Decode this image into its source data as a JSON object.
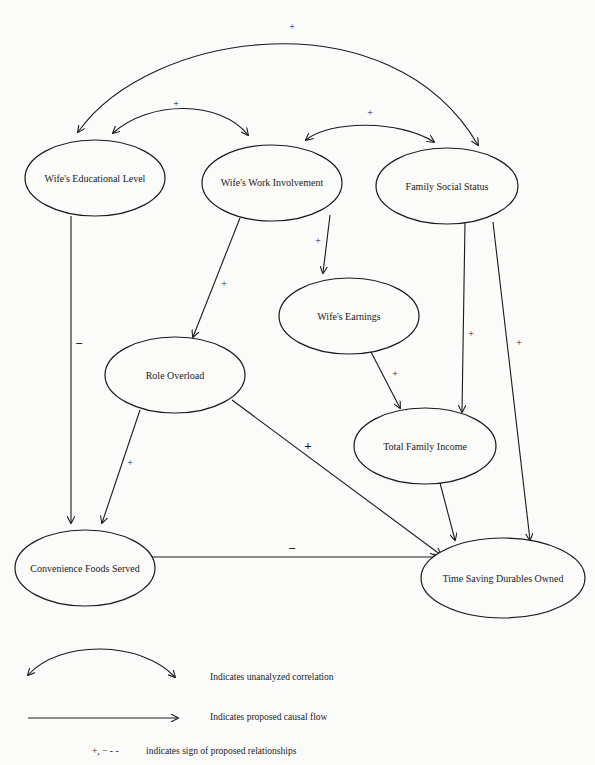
{
  "nodes": {
    "edu": {
      "label": "Wife's Educational Level"
    },
    "work": {
      "label": "Wife's Work Involvement"
    },
    "status": {
      "label": "Family Social Status"
    },
    "earnings": {
      "label": "Wife's Earnings"
    },
    "overload": {
      "label": "Role Overload"
    },
    "income": {
      "label": "Total Family Income"
    },
    "conv": {
      "label": "Convenience Foods Served"
    },
    "durables": {
      "label": "Time Saving Durables Owned"
    }
  },
  "edges": [
    {
      "from": "edu",
      "to": "status",
      "type": "correlation",
      "sign": "+"
    },
    {
      "from": "edu",
      "to": "work",
      "type": "correlation",
      "sign": "+"
    },
    {
      "from": "work",
      "to": "status",
      "type": "correlation",
      "sign": "+"
    },
    {
      "from": "edu",
      "to": "conv",
      "type": "causal",
      "sign": "−"
    },
    {
      "from": "work",
      "to": "overload",
      "type": "causal",
      "sign": "+"
    },
    {
      "from": "work",
      "to": "earnings",
      "type": "causal",
      "sign": "+"
    },
    {
      "from": "earnings",
      "to": "income",
      "type": "causal",
      "sign": "+"
    },
    {
      "from": "status",
      "to": "income",
      "type": "causal",
      "sign": "+"
    },
    {
      "from": "status",
      "to": "durables",
      "type": "causal",
      "sign": "+"
    },
    {
      "from": "overload",
      "to": "conv",
      "type": "causal",
      "sign": "+"
    },
    {
      "from": "overload",
      "to": "durables",
      "type": "causal",
      "sign": "+"
    },
    {
      "from": "income",
      "to": "durables",
      "type": "causal",
      "sign": ""
    },
    {
      "from": "durables",
      "to": "conv",
      "type": "correlation",
      "sign": "−"
    }
  ],
  "signs": {
    "plus": "+",
    "minus": "−"
  },
  "legend": {
    "correlation": "Indicates unanalyzed correlation",
    "causal": "Indicates proposed causal flow",
    "signs_symbol": "+, −    - -",
    "signs": "indicates sign of proposed relationships"
  }
}
